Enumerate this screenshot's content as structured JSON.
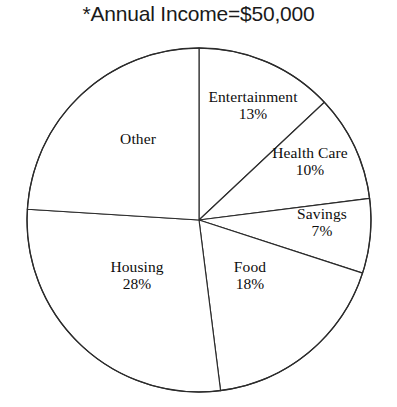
{
  "title": "*Annual Income=$50,000",
  "colors": {
    "background": "#ffffff",
    "outline": "#2b2b2b",
    "text": "#0d0d0d",
    "title_text": "#1a1a1a"
  },
  "chart_data": {
    "type": "pie",
    "title": "*Annual Income=$50,000",
    "xlabel": "",
    "ylabel": "",
    "legend": "none",
    "grid": false,
    "units": "percent",
    "total_label": "$50,000",
    "start_angle_deg": 0,
    "direction": "clockwise",
    "categories": [
      "Entertainment",
      "Health Care",
      "Savings",
      "Food",
      "Housing",
      "Other"
    ],
    "values": [
      13,
      10,
      7,
      18,
      28,
      24
    ],
    "slices": [
      {
        "label": "Entertainment",
        "value": 13,
        "value_text": "13%",
        "show_value": true,
        "start_deg": 0.0,
        "end_deg": 46.8,
        "label_x": 253,
        "label_y": 88
      },
      {
        "label": "Health Care",
        "value": 10,
        "value_text": "10%",
        "show_value": true,
        "start_deg": 46.8,
        "end_deg": 82.8,
        "label_x": 310,
        "label_y": 144
      },
      {
        "label": "Savings",
        "value": 7,
        "value_text": "7%",
        "show_value": true,
        "start_deg": 82.8,
        "end_deg": 108.0,
        "label_x": 322,
        "label_y": 205
      },
      {
        "label": "Food",
        "value": 18,
        "value_text": "18%",
        "show_value": true,
        "start_deg": 108.0,
        "end_deg": 172.8,
        "label_x": 250,
        "label_y": 258
      },
      {
        "label": "Housing",
        "value": 28,
        "value_text": "28%",
        "show_value": true,
        "start_deg": 172.8,
        "end_deg": 273.6,
        "label_x": 137,
        "label_y": 258
      },
      {
        "label": "Other",
        "value": 24,
        "value_text": "",
        "show_value": false,
        "start_deg": 273.6,
        "end_deg": 360.0,
        "label_x": 138,
        "label_y": 130
      }
    ],
    "geometry": {
      "center_x": 199,
      "center_y": 220,
      "radius": 172
    }
  }
}
